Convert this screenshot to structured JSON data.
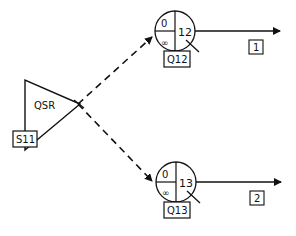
{
  "source": {
    "name": "QSR",
    "label": "S11"
  },
  "queues": [
    {
      "label": "Q12",
      "top_left": "0",
      "bottom_left": "∞",
      "right": "12",
      "output_label": "1"
    },
    {
      "label": "Q13",
      "top_left": "0",
      "bottom_left": "∞",
      "right": "13",
      "output_label": "2"
    }
  ],
  "colors": {
    "stroke": "#111111",
    "background": "#ffffff"
  }
}
